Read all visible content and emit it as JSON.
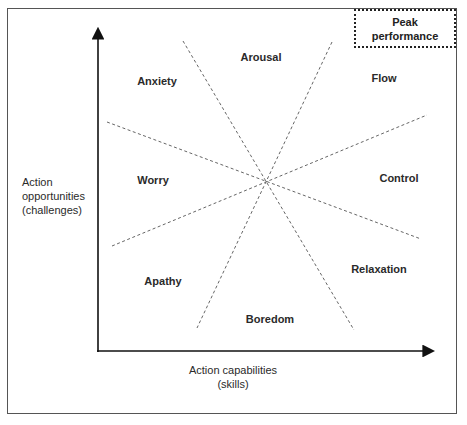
{
  "diagram": {
    "title": "",
    "peak_box": {
      "line1": "Peak",
      "line2": "performance"
    },
    "y_axis": {
      "line1": "Action",
      "line2": "opportunities",
      "line3": "(challenges)"
    },
    "x_axis": {
      "line1": "Action capabilities",
      "line2": "(skills)"
    },
    "regions": {
      "arousal": "Arousal",
      "flow": "Flow",
      "control": "Control",
      "relaxation": "Relaxation",
      "boredom": "Boredom",
      "apathy": "Apathy",
      "worry": "Worry",
      "anxiety": "Anxiety"
    },
    "colors": {
      "line": "#555555",
      "axis": "#111111",
      "text": "#2a2a2a"
    }
  }
}
